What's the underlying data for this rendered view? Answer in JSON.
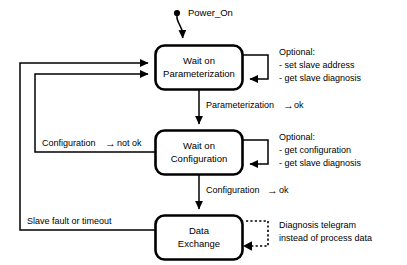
{
  "diagram": {
    "start": {
      "label": "Power_On",
      "marker": "start-dot"
    },
    "states": [
      {
        "id": "wait-on-parameterization",
        "line1": "Wait on",
        "line2": "Parameterization"
      },
      {
        "id": "wait-on-configuration",
        "line1": "Wait on",
        "line2": "Configuration"
      },
      {
        "id": "data-exchange",
        "line1": "Data",
        "line2": "Exchange"
      }
    ],
    "transitions": [
      {
        "id": "parameterization-ok",
        "text_before": "Parameterization",
        "arrow": "→",
        "text_after": "ok",
        "from": "wait-on-parameterization",
        "to": "wait-on-configuration"
      },
      {
        "id": "configuration-ok",
        "text_before": "Configuration",
        "arrow": "→",
        "text_after": "ok",
        "from": "wait-on-configuration",
        "to": "data-exchange"
      },
      {
        "id": "configuration-not-ok",
        "text_before": "Configuration",
        "arrow": "→",
        "text_after": "not ok",
        "from": "wait-on-configuration",
        "to": "wait-on-parameterization"
      },
      {
        "id": "slave-fault-or-timeout",
        "text_before": "Slave fault or timeout",
        "arrow": "",
        "text_after": "",
        "from": "data-exchange",
        "to": "wait-on-parameterization"
      }
    ],
    "notes": [
      {
        "id": "optional-parameterization",
        "line1": "Optional:",
        "line2": "- set slave address",
        "line3": "- get slave diagnosis",
        "style": "solid",
        "attached_to": "wait-on-parameterization"
      },
      {
        "id": "optional-configuration",
        "line1": "Optional:",
        "line2": "- get configuration",
        "line3": "- get slave diagnosis",
        "style": "solid",
        "attached_to": "wait-on-configuration"
      },
      {
        "id": "diagnosis-telegram",
        "line1": "Diagnosis telegram",
        "line2": "instead of process data",
        "line3": "",
        "style": "dotted",
        "attached_to": "data-exchange"
      }
    ],
    "colors": {
      "background": "#ffffff",
      "stroke": "#000000",
      "text": "#000000"
    }
  }
}
